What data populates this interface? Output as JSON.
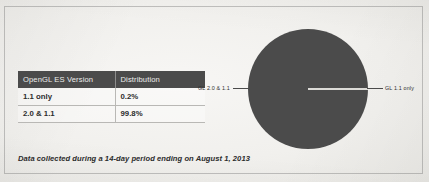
{
  "card": {
    "border_color": "#78787660"
  },
  "table": {
    "headers": [
      "OpenGL ES Version",
      "Distribution"
    ],
    "rows": [
      {
        "version": "1.1 only",
        "distribution": "0.2%"
      },
      {
        "version": "2.0 & 1.1",
        "distribution": "99.8%"
      }
    ],
    "header_bg": "#4b4b4b",
    "header_text_color": "#ededec"
  },
  "chart_data": {
    "type": "pie",
    "title": "",
    "categories": [
      "GL 2.0 & 1.1",
      "GL 1.1 only"
    ],
    "values": [
      99.8,
      0.2
    ],
    "unit": "%",
    "colors": [
      "#4b4b4b",
      "#dcdbd7"
    ],
    "labels": {
      "left": "GL 2.0 & 1.1",
      "right": "GL 1.1 only"
    },
    "legend_position": "callout-leader-lines",
    "start_angle_deg": 0,
    "grid": false
  },
  "footnote": {
    "text": "Data collected during a 14-day period ending on August 1, 2013"
  }
}
